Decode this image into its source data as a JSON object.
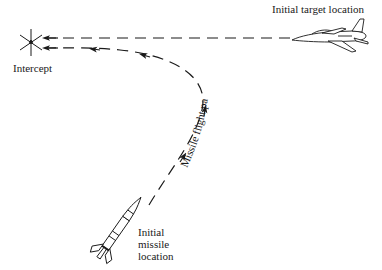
{
  "diagram": {
    "labels": {
      "target": "Initial target location",
      "intercept": "Intercept",
      "flight_path": "Missile flight path",
      "missile_lines": [
        "Initial",
        "missile",
        "location"
      ]
    },
    "elements": {
      "intercept_marker": "intercept-star-icon",
      "target": "aircraft-icon",
      "missile": "missile-icon",
      "target_path": "dashed-straight-line-with-arrows",
      "missile_path": "dashed-curved-line-with-arrows"
    },
    "colors": {
      "ink": "#1a1a1a",
      "background": "#ffffff"
    }
  }
}
